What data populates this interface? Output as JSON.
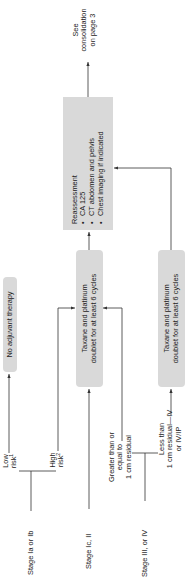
{
  "inputs": {
    "stage_1": "Stage Ia or Ib",
    "stage_2": "Stage Ic, II",
    "stage_3": "Stage III, or IV"
  },
  "branches": {
    "low_risk": "Low",
    "low_risk_2": "risk",
    "low_risk_sup": "1",
    "high_risk": "High",
    "high_risk_2": "risk",
    "high_risk_sup": "2",
    "ge_1cm_1": "Greater than or",
    "ge_1cm_2": "equal to",
    "ge_1cm_3": "1 cm residual",
    "lt_1cm_1": "Less than",
    "lt_1cm_2": "1 cm residual—IV",
    "lt_1cm_3": "or IV/IP"
  },
  "boxes": {
    "no_adjuvant": "No adjuvant therapy",
    "taxane_1_line1": "Taxane and platinum",
    "taxane_1_line2": "doublet for at least 6 cycles",
    "taxane_2_line1": "Taxane and platinum",
    "taxane_2_line2": "doublet for at least 6 cycles",
    "reassessment": {
      "title": "Reassessment",
      "items": [
        "CA 125",
        "CT abdomen and pelvis",
        "Chest imaging if indicated"
      ]
    }
  },
  "outputs": {
    "see_1": "See",
    "see_2": "consolidation",
    "see_3": "on page 3"
  },
  "colors": {
    "box_fill": "#d9d9d9",
    "line": "#333333"
  }
}
